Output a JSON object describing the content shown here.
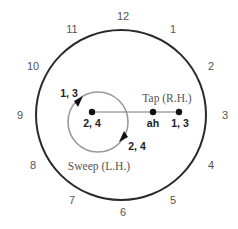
{
  "diagram": {
    "clock_numbers": [
      {
        "label": "12",
        "x": 123,
        "y": 20
      },
      {
        "label": "1",
        "x": 173,
        "y": 33
      },
      {
        "label": "2",
        "x": 211,
        "y": 70
      },
      {
        "label": "3",
        "x": 225,
        "y": 119
      },
      {
        "label": "4",
        "x": 211,
        "y": 169
      },
      {
        "label": "5",
        "x": 173,
        "y": 204
      },
      {
        "label": "6",
        "x": 123,
        "y": 216
      },
      {
        "label": "7",
        "x": 72,
        "y": 204
      },
      {
        "label": "8",
        "x": 33,
        "y": 169
      },
      {
        "label": "9",
        "x": 20,
        "y": 119
      },
      {
        "label": "10",
        "x": 33,
        "y": 70
      },
      {
        "label": "11",
        "x": 72,
        "y": 33
      }
    ],
    "outer_circle": {
      "cx": 121,
      "cy": 115,
      "r": 85,
      "color": "#2a2a2a"
    },
    "inner_circle": {
      "cx": 98,
      "cy": 122,
      "r": 30,
      "color": "#999999"
    },
    "tap_line": {
      "x1": 92,
      "y1": 112,
      "x2": 179,
      "y2": 112,
      "color": "#777777"
    },
    "dots": [
      {
        "cx": 92,
        "cy": 112
      },
      {
        "cx": 153,
        "cy": 112
      },
      {
        "cx": 179,
        "cy": 112
      }
    ],
    "labels": {
      "center_beats": "2, 4",
      "ah": "ah",
      "tap_beats": "1, 3",
      "sweep_start_beats": "1, 3",
      "sweep_end_beats": "2, 4",
      "tap_title": "Tap (R.H.)",
      "sweep_title": "Sweep (L.H.)"
    }
  }
}
